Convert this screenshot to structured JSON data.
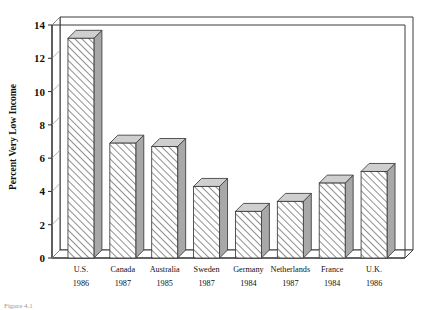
{
  "chart_data": {
    "type": "bar",
    "title": "",
    "subtitle": "",
    "xlabel": "",
    "ylabel": "Percent Very Low Income",
    "ylim": [
      0,
      14
    ],
    "yticks": [
      0,
      2,
      4,
      6,
      8,
      10,
      12,
      14
    ],
    "grid": false,
    "legend": null,
    "style": "3d-hatched-bars",
    "categories": [
      "U.S.",
      "Canada",
      "Australia",
      "Sweden",
      "Germany",
      "Netherlands",
      "France",
      "U.K."
    ],
    "years": [
      "1986",
      "1987",
      "1985",
      "1987",
      "1984",
      "1987",
      "1984",
      "1986"
    ],
    "values": [
      13.2,
      6.9,
      6.7,
      4.3,
      2.8,
      3.4,
      4.5,
      5.2
    ],
    "series": [
      {
        "name": "Percent Very Low Income",
        "values": [
          13.2,
          6.9,
          6.7,
          4.3,
          2.8,
          3.4,
          4.5,
          5.2
        ]
      }
    ],
    "colors": {
      "bar_front": "#ffffff",
      "bar_hatch": "#555555",
      "bar_top": "#cfcfcf",
      "bar_side": "#a8a8a8",
      "axis": "#2b2b2b",
      "frame": "#3b3b3b",
      "text": "#111111"
    }
  },
  "axis": {
    "y_title": "Percent Very Low Income",
    "tick_labels": [
      "0",
      "2",
      "4",
      "6",
      "8",
      "10",
      "12",
      "14"
    ]
  },
  "categories": [
    {
      "label": "U.S.",
      "year": "1986",
      "value": 13.2
    },
    {
      "label": "Canada",
      "year": "1987",
      "value": 6.9
    },
    {
      "label": "Australia",
      "year": "1985",
      "value": 6.7
    },
    {
      "label": "Sweden",
      "year": "1987",
      "value": 4.3
    },
    {
      "label": "Germany",
      "year": "1984",
      "value": 2.8
    },
    {
      "label": "Netherlands",
      "year": "1987",
      "value": 3.4
    },
    {
      "label": "France",
      "year": "1984",
      "value": 4.5
    },
    {
      "label": "U.K.",
      "year": "1986",
      "value": 5.2
    }
  ],
  "caption": {
    "text": "Figure 4.1"
  }
}
